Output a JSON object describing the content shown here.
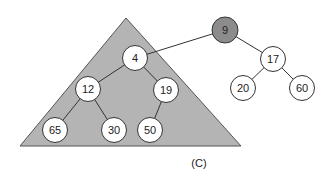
{
  "diagram": {
    "caption": "(C)",
    "subtree_triangle": {
      "fill": "#b4b4b4",
      "stroke": "#555555"
    },
    "root": {
      "label": "9",
      "fill": "#8c8c8c"
    },
    "nodes": [
      {
        "id": "n9",
        "label": "9"
      },
      {
        "id": "n4",
        "label": "4"
      },
      {
        "id": "n17",
        "label": "17"
      },
      {
        "id": "n12",
        "label": "12"
      },
      {
        "id": "n19",
        "label": "19"
      },
      {
        "id": "n20",
        "label": "20"
      },
      {
        "id": "n60",
        "label": "60"
      },
      {
        "id": "n65",
        "label": "65"
      },
      {
        "id": "n30",
        "label": "30"
      },
      {
        "id": "n50",
        "label": "50"
      }
    ],
    "edges": [
      [
        "9",
        "4"
      ],
      [
        "9",
        "17"
      ],
      [
        "4",
        "12"
      ],
      [
        "4",
        "19"
      ],
      [
        "17",
        "20"
      ],
      [
        "17",
        "60"
      ],
      [
        "12",
        "65"
      ],
      [
        "12",
        "30"
      ],
      [
        "19",
        "50"
      ]
    ]
  }
}
